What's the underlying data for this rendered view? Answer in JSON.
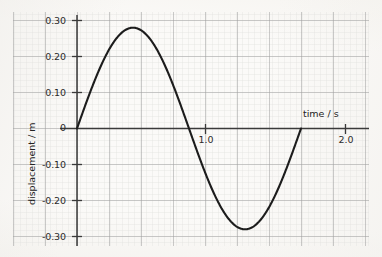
{
  "chart_data": {
    "type": "line",
    "title": "",
    "subtitle": "",
    "xlabel": "time / s",
    "ylabel": "displacement / m",
    "xlim": [
      -0.1,
      2.1
    ],
    "ylim": [
      -0.32,
      0.32
    ],
    "grid": true,
    "grid_major_x": 0.25,
    "grid_major_y": 0.1,
    "grid_minor_x": 0.05,
    "grid_minor_y": 0.02,
    "legend": "none",
    "x_ticks": [
      {
        "value": 1.0,
        "label": "1.0"
      },
      {
        "value": 2.0,
        "label": "2.0"
      }
    ],
    "y_ticks": [
      {
        "value": 0.3,
        "label": "0.30"
      },
      {
        "value": 0.2,
        "label": "0.20"
      },
      {
        "value": 0.1,
        "label": "0.10"
      },
      {
        "value": 0.0,
        "label": "0"
      },
      {
        "value": -0.1,
        "label": "-0.10"
      },
      {
        "value": -0.2,
        "label": "-0.20"
      },
      {
        "value": -0.3,
        "label": "-0.30"
      }
    ],
    "series": [
      {
        "name": "displacement",
        "waveform": "sine",
        "amplitude": 0.28,
        "period": 1.6,
        "phase": 0.0,
        "x_start": 0.0,
        "x_end": 1.6,
        "color": "#1c1c1c",
        "linewidth": 2.1,
        "points": [
          {
            "x": 0.0,
            "y": 0.0
          },
          {
            "x": 0.1,
            "y": 0.107
          },
          {
            "x": 0.2,
            "y": 0.198
          },
          {
            "x": 0.3,
            "y": 0.259
          },
          {
            "x": 0.4,
            "y": 0.28
          },
          {
            "x": 0.5,
            "y": 0.259
          },
          {
            "x": 0.6,
            "y": 0.198
          },
          {
            "x": 0.7,
            "y": 0.107
          },
          {
            "x": 0.8,
            "y": 0.0
          },
          {
            "x": 0.9,
            "y": -0.107
          },
          {
            "x": 1.0,
            "y": -0.198
          },
          {
            "x": 1.1,
            "y": -0.259
          },
          {
            "x": 1.2,
            "y": -0.28
          },
          {
            "x": 1.3,
            "y": -0.259
          },
          {
            "x": 1.4,
            "y": -0.198
          },
          {
            "x": 1.5,
            "y": -0.107
          },
          {
            "x": 1.6,
            "y": 0.0
          }
        ]
      }
    ],
    "annotations": [
      {
        "name": "peak",
        "x": 0.4,
        "y": 0.28
      },
      {
        "name": "trough",
        "x": 1.2,
        "y": -0.28
      },
      {
        "name": "zero-crossing-mid",
        "x": 0.8,
        "y": 0.0
      },
      {
        "name": "zero-crossing-end",
        "x": 1.6,
        "y": 0.0
      }
    ]
  },
  "colors": {
    "background": "#fbfaf8",
    "grid_major": "#9b9b9b",
    "grid_minor": "#dedcd8",
    "axis": "#3a3a3a",
    "curve": "#1c1c1c",
    "text": "#222222"
  }
}
